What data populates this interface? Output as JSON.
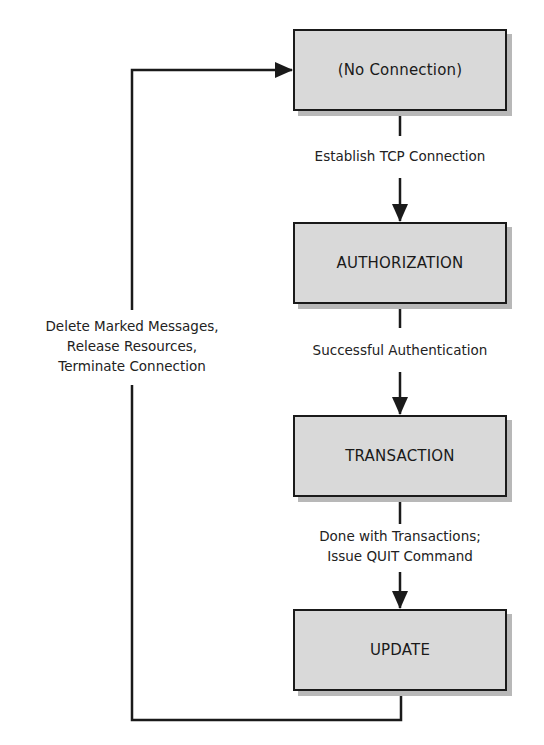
{
  "diagram": {
    "type": "state-machine",
    "states": [
      {
        "id": "no-connection",
        "label": "(No Connection)"
      },
      {
        "id": "authorization",
        "label": "AUTHORIZATION"
      },
      {
        "id": "transaction",
        "label": "TRANSACTION"
      },
      {
        "id": "update",
        "label": "UPDATE"
      }
    ],
    "transitions": [
      {
        "from": "no-connection",
        "to": "authorization",
        "label": "Establish TCP Connection"
      },
      {
        "from": "authorization",
        "to": "transaction",
        "label": "Successful Authentication"
      },
      {
        "from": "transaction",
        "to": "update",
        "label_lines": [
          "Done with Transactions;",
          "Issue QUIT Command"
        ]
      },
      {
        "from": "update",
        "to": "no-connection",
        "label_lines": [
          "Delete Marked Messages,",
          "Release Resources,",
          "Terminate Connection"
        ]
      }
    ],
    "colors": {
      "box_fill": "#d9d9d9",
      "line": "#1a1a1a",
      "shadow": "#b8b8b8"
    }
  }
}
